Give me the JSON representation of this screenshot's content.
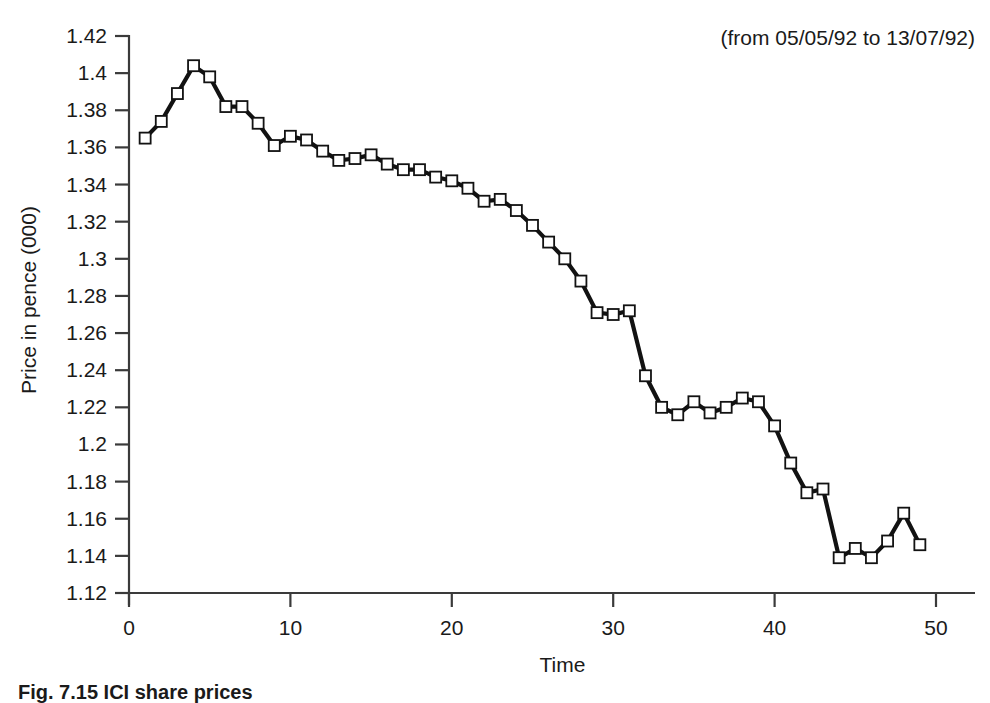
{
  "chart_data": {
    "type": "line",
    "title": "",
    "subtitle": "",
    "annotation": "(from 05/05/92 to 13/07/92)",
    "xlabel": "Time",
    "ylabel": "Price in pence (000)",
    "xlim": [
      0,
      50
    ],
    "ylim": [
      1.12,
      1.42
    ],
    "xticks": [
      0,
      10,
      20,
      30,
      40,
      50
    ],
    "xtick_labels": [
      "0",
      "10",
      "20",
      "30",
      "40",
      "50"
    ],
    "yticks": [
      1.12,
      1.14,
      1.16,
      1.18,
      1.2,
      1.22,
      1.24,
      1.26,
      1.28,
      1.3,
      1.32,
      1.34,
      1.36,
      1.38,
      1.4,
      1.42
    ],
    "ytick_labels": [
      "1.12",
      "1.14",
      "1.16",
      "1.18",
      "1.2",
      "1.22",
      "1.24",
      "1.26",
      "1.28",
      "1.3",
      "1.32",
      "1.34",
      "1.36",
      "1.38",
      "1.4",
      "1.42"
    ],
    "grid": false,
    "legend": false,
    "marker": "open-square",
    "x": [
      1,
      2,
      3,
      4,
      5,
      6,
      7,
      8,
      9,
      10,
      11,
      12,
      13,
      14,
      15,
      16,
      17,
      18,
      19,
      20,
      21,
      22,
      23,
      24,
      25,
      26,
      27,
      28,
      29,
      30,
      31,
      32,
      33,
      34,
      35,
      36,
      37,
      38,
      39,
      40,
      41,
      42,
      43,
      44,
      45,
      46,
      47,
      48,
      49
    ],
    "values": [
      1.365,
      1.374,
      1.389,
      1.404,
      1.398,
      1.382,
      1.382,
      1.373,
      1.361,
      1.366,
      1.364,
      1.358,
      1.353,
      1.354,
      1.356,
      1.351,
      1.348,
      1.348,
      1.344,
      1.342,
      1.338,
      1.331,
      1.332,
      1.326,
      1.318,
      1.309,
      1.3,
      1.288,
      1.271,
      1.27,
      1.272,
      1.237,
      1.22,
      1.216,
      1.223,
      1.217,
      1.22,
      1.225,
      1.223,
      1.21,
      1.19,
      1.174,
      1.176,
      1.139,
      1.144,
      1.139,
      1.148,
      1.163,
      1.146
    ],
    "series": [
      {
        "name": "ICI share price",
        "values": [
          1.365,
          1.374,
          1.389,
          1.404,
          1.398,
          1.382,
          1.382,
          1.373,
          1.361,
          1.366,
          1.364,
          1.358,
          1.353,
          1.354,
          1.356,
          1.351,
          1.348,
          1.348,
          1.344,
          1.342,
          1.338,
          1.331,
          1.332,
          1.326,
          1.318,
          1.309,
          1.3,
          1.288,
          1.271,
          1.27,
          1.272,
          1.237,
          1.22,
          1.216,
          1.223,
          1.217,
          1.22,
          1.225,
          1.223,
          1.21,
          1.19,
          1.174,
          1.176,
          1.139,
          1.144,
          1.139,
          1.148,
          1.163,
          1.146
        ]
      }
    ]
  },
  "caption": {
    "text": "Fig. 7.15 ICI share prices"
  }
}
